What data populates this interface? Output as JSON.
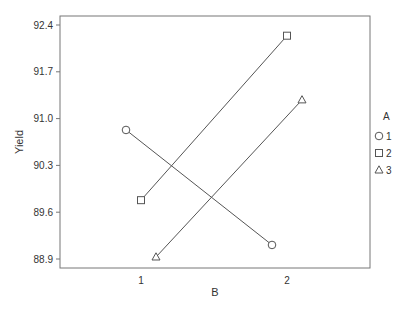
{
  "chart_data": {
    "type": "line",
    "title": "",
    "xlabel": "B",
    "ylabel": "Yield",
    "categories": [
      "1",
      "2"
    ],
    "yticks": [
      "92.4",
      "91.7",
      "91.0",
      "90.3",
      "89.6",
      "88.9"
    ],
    "ylim": [
      88.9,
      92.4
    ],
    "grid": false,
    "legend": {
      "title": "A",
      "position": "right",
      "entries": [
        {
          "label": "1",
          "marker": "circle"
        },
        {
          "label": "2",
          "marker": "square"
        },
        {
          "label": "3",
          "marker": "triangle"
        }
      ]
    },
    "series": [
      {
        "name": "1",
        "marker": "circle",
        "values": [
          90.83,
          89.11
        ]
      },
      {
        "name": "2",
        "marker": "square",
        "values": [
          89.78,
          92.24
        ]
      },
      {
        "name": "3",
        "marker": "triangle",
        "values": [
          88.93,
          91.28
        ]
      }
    ],
    "colors": {
      "line": "#555555",
      "axis": "#666666"
    }
  }
}
